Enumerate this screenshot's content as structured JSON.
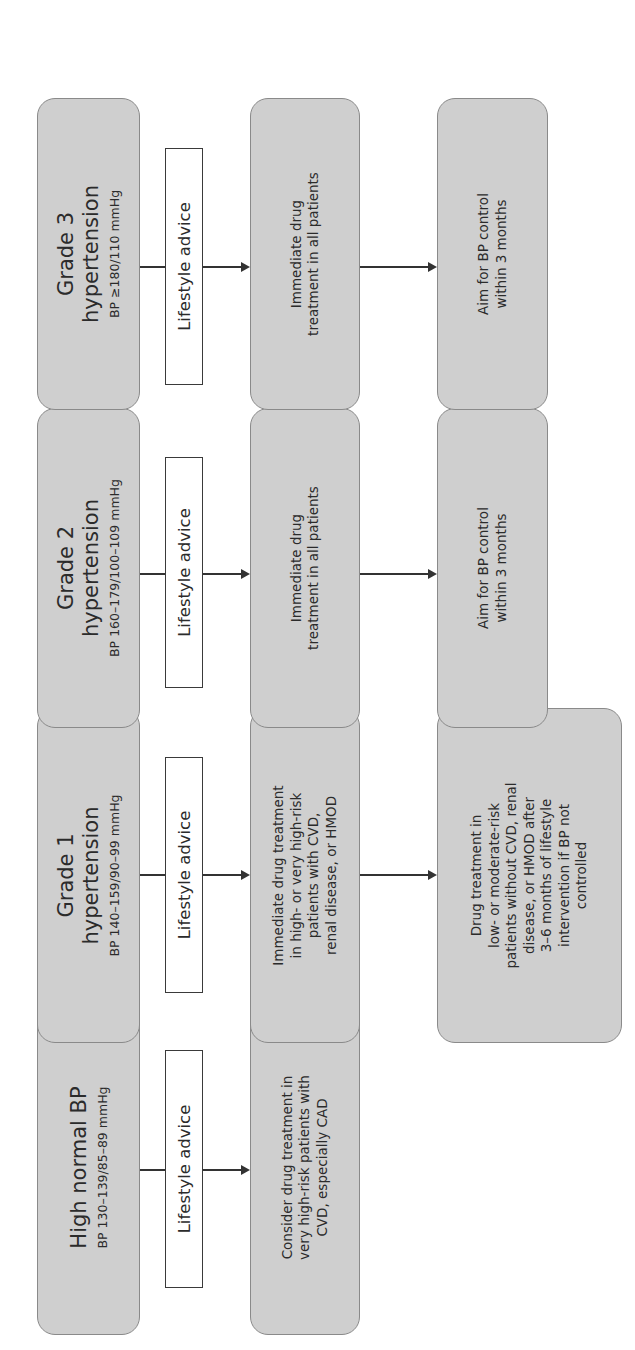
{
  "colors": {
    "box_fill": "#cfcfcf",
    "box_border": "#8a8a8a",
    "arrow": "#333333",
    "text": "#2b2b2b",
    "background": "#ffffff"
  },
  "rows": [
    {
      "id": "high-normal",
      "category": "High normal BP",
      "range": "BP 130–139/85–89 mmHg",
      "lifestyle": "Lifestyle advice",
      "treatment": "Consider drug treatment in very high-risk patients with CVD, especially CAD",
      "followup": null
    },
    {
      "id": "grade-1",
      "category": "Grade 1 hypertension",
      "range": "BP 140–159/90–99 mmHg",
      "lifestyle": "Lifestyle advice",
      "treatment": "Immediate drug treatment in high- or very high-risk patients with CVD, renal disease, or HMOD",
      "followup": "Drug treatment in low- or moderate-risk patients without CVD, renal disease, or HMOD after 3–6 months of lifestyle intervention if BP not controlled"
    },
    {
      "id": "grade-2",
      "category": "Grade 2 hypertension",
      "range": "BP 160–179/100–109 mmHg",
      "lifestyle": "Lifestyle advice",
      "treatment": "Immediate drug treatment in all patients",
      "followup": "Aim for BP control within 3 months"
    },
    {
      "id": "grade-3",
      "category": "Grade 3 hypertension",
      "range": "BP ≥180/110 mmHg",
      "lifestyle": "Lifestyle advice",
      "treatment": "Immediate drug treatment in all patients",
      "followup": "Aim for BP control within 3 months"
    }
  ],
  "display": {
    "high_normal": {
      "title_lines": [
        "High normal BP"
      ],
      "range": "BP 130–139/85–89 mmHg",
      "lifestyle": "Lifestyle advice",
      "treatment_lines": [
        "Consider drug treatment in",
        "very high-risk patients with",
        "CVD, especially CAD"
      ]
    },
    "grade1": {
      "title_lines": [
        "Grade 1",
        "hypertension"
      ],
      "range": "BP 140–159/90–99 mmHg",
      "lifestyle": "Lifestyle advice",
      "treatment_lines": [
        "Immediate drug treatment",
        "in high- or very high-risk",
        "patients with CVD,",
        "renal disease, or HMOD"
      ],
      "followup_lines": [
        "Drug treatment in",
        "low- or moderate-risk",
        "patients without CVD, renal",
        "disease, or HMOD after",
        "3–6 months of lifestyle",
        "intervention if BP not",
        "controlled"
      ]
    },
    "grade2": {
      "title_lines": [
        "Grade 2",
        "hypertension"
      ],
      "range": "BP 160–179/100–109 mmHg",
      "lifestyle": "Lifestyle advice",
      "treatment_lines": [
        "Immediate drug",
        "treatment in all patients"
      ],
      "followup_lines": [
        "Aim for BP control",
        "within 3 months"
      ]
    },
    "grade3": {
      "title_lines": [
        "Grade 3",
        "hypertension"
      ],
      "range": "BP ≥180/110 mmHg",
      "lifestyle": "Lifestyle advice",
      "treatment_lines": [
        "Immediate drug",
        "treatment in all patients"
      ],
      "followup_lines": [
        "Aim for BP control",
        "within 3 months"
      ]
    }
  }
}
